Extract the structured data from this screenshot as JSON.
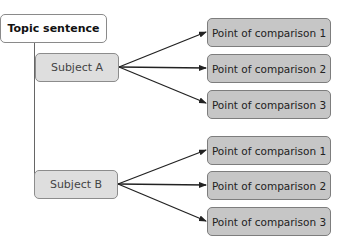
{
  "diagram": {
    "topic": {
      "label": "Topic sentence"
    },
    "subjects": [
      {
        "label": "Subject A",
        "points": [
          {
            "label": "Point of comparison 1"
          },
          {
            "label": "Point of comparison 2"
          },
          {
            "label": "Point of comparison 3"
          }
        ]
      },
      {
        "label": "Subject B",
        "points": [
          {
            "label": "Point of comparison 1"
          },
          {
            "label": "Point of comparison 2"
          },
          {
            "label": "Point of comparison 3"
          }
        ]
      }
    ],
    "colors": {
      "topic_fill": "#ffffff",
      "subject_fill": "#dedede",
      "point_fill": "#c6c6c6",
      "border": "#8a8a8a",
      "arrow": "#222222"
    }
  }
}
